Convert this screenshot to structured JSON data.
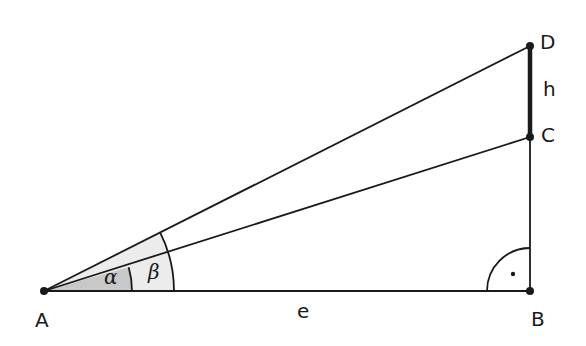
{
  "diagram": {
    "type": "right-triangle-geometry",
    "points": {
      "A": {
        "label": "A",
        "x": 44,
        "y": 291
      },
      "B": {
        "label": "B",
        "x": 530,
        "y": 291
      },
      "C": {
        "label": "C",
        "x": 530,
        "y": 137
      },
      "D": {
        "label": "D",
        "x": 530,
        "y": 46
      }
    },
    "segments": {
      "AB": {
        "label": "e"
      },
      "CD": {
        "label": "h",
        "bold": true
      }
    },
    "angles": {
      "alpha": {
        "label": "α",
        "fill": "#c8c8c8"
      },
      "beta": {
        "label": "β",
        "fill": "#ececec"
      },
      "right_angle": {
        "at": "B",
        "marker": "·"
      }
    },
    "colors": {
      "line": "#1a1a1a",
      "alpha_fill": "#c8c8c8",
      "beta_fill": "#ececec"
    }
  }
}
